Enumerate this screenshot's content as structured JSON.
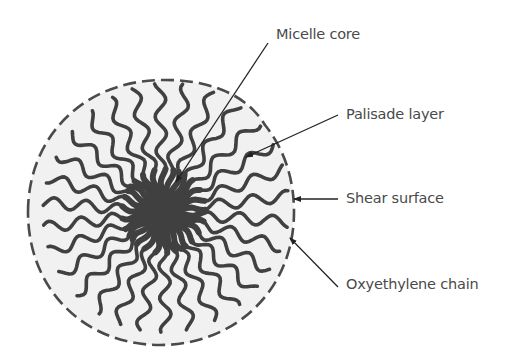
{
  "diagram": {
    "colors": {
      "background": "#ffffff",
      "micelle_fill": "#f1f1f1",
      "chain": "#404040",
      "outline": "#4a4a4a",
      "leader": "#222222",
      "text": "#4a4a4a"
    },
    "labels": [
      {
        "id": "micelle-core",
        "text": "Micelle core",
        "x": 276,
        "y": 26
      },
      {
        "id": "palisade-layer",
        "text": "Palisade layer",
        "x": 346,
        "y": 106
      },
      {
        "id": "shear-surface",
        "text": "Shear surface",
        "x": 346,
        "y": 190
      },
      {
        "id": "oxyethylene-chain",
        "text": "Oxyethylene chain",
        "x": 346,
        "y": 276
      }
    ],
    "leaders": [
      {
        "id": "micelle-core",
        "x1": 268,
        "y1": 43,
        "x2": 176,
        "y2": 182
      },
      {
        "id": "palisade-layer",
        "x1": 338,
        "y1": 115,
        "x2": 246,
        "y2": 157
      },
      {
        "id": "shear-surface",
        "x1": 338,
        "y1": 199,
        "x2": 294,
        "y2": 199
      },
      {
        "id": "oxyethylene-chain",
        "x1": 338,
        "y1": 287,
        "x2": 290,
        "y2": 238
      }
    ],
    "core": {
      "cx": 163,
      "cy": 212,
      "r": 22
    },
    "chain_count": 30
  }
}
